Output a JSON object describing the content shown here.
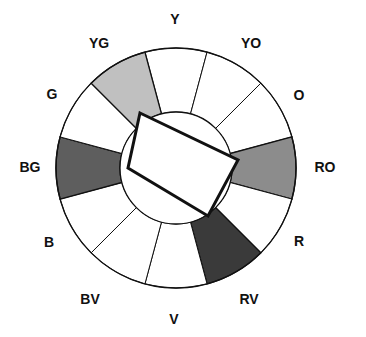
{
  "diagram": {
    "type": "color-wheel",
    "geometry": {
      "center_x": 176,
      "center_y": 168,
      "outer_radius": 120,
      "inner_radius": 56,
      "segment_count": 12,
      "segment_degrees": 30
    },
    "colors": {
      "outline": "#111111",
      "background": "#ffffff",
      "unselected_fill": "#ffffff",
      "highlight_light": "#c0c0c0",
      "highlight_mid": "#8c8c8c",
      "highlight_dark": "#5e5e5e",
      "highlight_darkest": "#3a3a3a"
    },
    "segments": [
      {
        "id": "Y",
        "label": "Y",
        "angle_deg": 90,
        "highlighted": false,
        "fill": "#ffffff",
        "label_x": 175,
        "label_y": 20
      },
      {
        "id": "YO",
        "label": "YO",
        "angle_deg": 60,
        "highlighted": false,
        "fill": "#ffffff",
        "label_x": 251,
        "label_y": 44
      },
      {
        "id": "O",
        "label": "O",
        "angle_deg": 30,
        "highlighted": false,
        "fill": "#ffffff",
        "label_x": 299,
        "label_y": 96
      },
      {
        "id": "RO",
        "label": "RO",
        "angle_deg": 0,
        "highlighted": true,
        "fill": "#8c8c8c",
        "label_x": 325,
        "label_y": 168
      },
      {
        "id": "R",
        "label": "R",
        "angle_deg": 330,
        "highlighted": false,
        "fill": "#ffffff",
        "label_x": 299,
        "label_y": 242
      },
      {
        "id": "RV",
        "label": "RV",
        "angle_deg": 300,
        "highlighted": true,
        "fill": "#3a3a3a",
        "label_x": 249,
        "label_y": 300
      },
      {
        "id": "V",
        "label": "V",
        "angle_deg": 270,
        "highlighted": false,
        "fill": "#ffffff",
        "label_x": 174,
        "label_y": 320
      },
      {
        "id": "BV",
        "label": "BV",
        "angle_deg": 240,
        "highlighted": false,
        "fill": "#ffffff",
        "label_x": 90,
        "label_y": 300
      },
      {
        "id": "B",
        "label": "B",
        "angle_deg": 210,
        "highlighted": false,
        "fill": "#ffffff",
        "label_x": 49,
        "label_y": 243
      },
      {
        "id": "BG",
        "label": "BG",
        "angle_deg": 180,
        "highlighted": true,
        "fill": "#5e5e5e",
        "label_x": 30,
        "label_y": 168
      },
      {
        "id": "G",
        "label": "G",
        "angle_deg": 150,
        "highlighted": false,
        "fill": "#ffffff",
        "label_x": 52,
        "label_y": 95
      },
      {
        "id": "YG",
        "label": "YG",
        "angle_deg": 120,
        "highlighted": true,
        "fill": "#c0c0c0",
        "label_x": 99,
        "label_y": 44
      }
    ],
    "harmony_rectangle": {
      "name": "tetrad-rectangle",
      "corner_labels": [
        "YG",
        "RO",
        "RV",
        "BG"
      ],
      "points": [
        {
          "x": 140,
          "y": 113
        },
        {
          "x": 238,
          "y": 160
        },
        {
          "x": 208,
          "y": 216
        },
        {
          "x": 128,
          "y": 168
        }
      ],
      "stroke": "#111111",
      "stroke_width": 3,
      "fill": "#ffffff"
    }
  }
}
